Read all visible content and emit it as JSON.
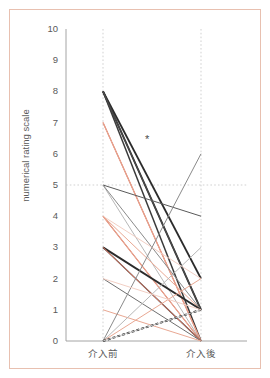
{
  "chart_data": {
    "type": "line",
    "title": "",
    "subtitle": "",
    "xlabel": "",
    "ylabel": "numerical rating scale",
    "categories": [
      "介入前",
      "介入後"
    ],
    "x_tick_labels": [
      "介入前",
      "介入後"
    ],
    "y_tick_labels": [
      "0",
      "1",
      "2",
      "3",
      "4",
      "5",
      "6",
      "7",
      "8",
      "9",
      "10"
    ],
    "y_ticks": [
      0,
      1,
      2,
      3,
      4,
      5,
      6,
      7,
      8,
      9,
      10
    ],
    "ylim": [
      0,
      10
    ],
    "xlim": [
      0,
      1
    ],
    "grid": "dotted vertical gridlines at each category; dotted horizontal reference line at y=5",
    "reference_line_y": 5,
    "legend": "none",
    "legend_position": "none",
    "annotations": [
      {
        "text": "*",
        "x_fraction": 0.46,
        "y_value": 6.45,
        "name": "significance-asterisk"
      }
    ],
    "colors": {
      "dark": "#2b2b2b",
      "gray": "#6f6f6f",
      "light_gray": "#b8b8b8",
      "salmon": "#d9705a",
      "light_salmon": "#e9a893",
      "pale_salmon": "#f2cfc4",
      "border": "#e8c0b0",
      "axis": "#8a8a8a",
      "text": "#5a5a5a",
      "background": "#ffffff"
    },
    "series": [
      {
        "name": "p1",
        "values": [
          8,
          1
        ],
        "color": "#2b2b2b",
        "width": 1.9,
        "dash": "none"
      },
      {
        "name": "p2",
        "values": [
          8,
          2
        ],
        "color": "#2b2b2b",
        "width": 1.9,
        "dash": "none"
      },
      {
        "name": "p3",
        "values": [
          8,
          0
        ],
        "color": "#3a3a3a",
        "width": 1.5,
        "dash": "none"
      },
      {
        "name": "p4",
        "values": [
          8,
          1
        ],
        "color": "#4a4a4a",
        "width": 1.2,
        "dash": "none"
      },
      {
        "name": "p5",
        "values": [
          7,
          0
        ],
        "color": "#d9705a",
        "width": 1.2,
        "dash": "none"
      },
      {
        "name": "p6",
        "values": [
          7,
          0
        ],
        "color": "#e9a893",
        "width": 1.0,
        "dash": "none"
      },
      {
        "name": "p7",
        "values": [
          5,
          4
        ],
        "color": "#5a5a5a",
        "width": 1.0,
        "dash": "none"
      },
      {
        "name": "p8",
        "values": [
          5,
          0
        ],
        "color": "#b8b8b8",
        "width": 1.0,
        "dash": "none"
      },
      {
        "name": "p9",
        "values": [
          5,
          1
        ],
        "color": "#8a8a8a",
        "width": 1.0,
        "dash": "none"
      },
      {
        "name": "p10",
        "values": [
          4,
          0
        ],
        "color": "#d9705a",
        "width": 1.1,
        "dash": "none"
      },
      {
        "name": "p11",
        "values": [
          4,
          0
        ],
        "color": "#e9a893",
        "width": 1.0,
        "dash": "none"
      },
      {
        "name": "p12",
        "values": [
          4,
          2
        ],
        "color": "#f2cfc4",
        "width": 1.0,
        "dash": "none"
      },
      {
        "name": "p13",
        "values": [
          4,
          1
        ],
        "color": "#e9a893",
        "width": 1.0,
        "dash": "none"
      },
      {
        "name": "p14",
        "values": [
          3,
          1
        ],
        "color": "#2b2b2b",
        "width": 1.9,
        "dash": "none"
      },
      {
        "name": "p15",
        "values": [
          3,
          0
        ],
        "color": "#4a4a4a",
        "width": 1.3,
        "dash": "none"
      },
      {
        "name": "p16",
        "values": [
          3,
          0
        ],
        "color": "#d9705a",
        "width": 1.0,
        "dash": "none"
      },
      {
        "name": "p17",
        "values": [
          2,
          0
        ],
        "color": "#6f6f6f",
        "width": 1.0,
        "dash": "none"
      },
      {
        "name": "p18",
        "values": [
          1,
          0
        ],
        "color": "#e9a893",
        "width": 1.0,
        "dash": "none"
      },
      {
        "name": "p19",
        "values": [
          0,
          6
        ],
        "color": "#8a8a8a",
        "width": 1.0,
        "dash": "none"
      },
      {
        "name": "p20",
        "values": [
          0,
          3
        ],
        "color": "#b8b8b8",
        "width": 1.0,
        "dash": "none"
      },
      {
        "name": "p21",
        "values": [
          0,
          2
        ],
        "color": "#e9a893",
        "width": 1.0,
        "dash": "none"
      },
      {
        "name": "p22",
        "values": [
          0,
          1
        ],
        "color": "#1a1a1a",
        "width": 1.9,
        "dash": "3,2"
      },
      {
        "name": "p23",
        "values": [
          0,
          1
        ],
        "color": "#c8c8c8",
        "width": 1.0,
        "dash": "none"
      },
      {
        "name": "p24",
        "values": [
          2,
          1
        ],
        "color": "#f2cfc4",
        "width": 1.0,
        "dash": "none"
      }
    ]
  }
}
